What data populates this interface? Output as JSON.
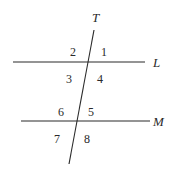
{
  "diagram": {
    "type": "parallel-lines-transversal",
    "lines": [
      {
        "id": "T",
        "label": "T",
        "x1": 94,
        "y1": 30,
        "x2": 69,
        "y2": 164,
        "label_x": 92,
        "label_y": 22
      },
      {
        "id": "L",
        "label": "L",
        "x1": 13,
        "y1": 62,
        "x2": 145,
        "y2": 62,
        "label_x": 153,
        "label_y": 67
      },
      {
        "id": "M",
        "label": "M",
        "x1": 21,
        "y1": 121,
        "x2": 150,
        "y2": 121,
        "label_x": 153,
        "label_y": 126
      }
    ],
    "angles": [
      {
        "label": "1",
        "x": 101,
        "y": 56
      },
      {
        "label": "2",
        "x": 70,
        "y": 56
      },
      {
        "label": "3",
        "x": 66,
        "y": 83
      },
      {
        "label": "4",
        "x": 97,
        "y": 83
      },
      {
        "label": "5",
        "x": 88,
        "y": 116
      },
      {
        "label": "6",
        "x": 58,
        "y": 116
      },
      {
        "label": "7",
        "x": 54,
        "y": 143
      },
      {
        "label": "8",
        "x": 84,
        "y": 143
      }
    ]
  }
}
